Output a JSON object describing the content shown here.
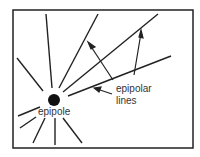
{
  "diagram": {
    "labels": {
      "epipole": "epipole",
      "epipolar_line1": "epipolar",
      "epipolar_line2": "lines"
    },
    "colors": {
      "stroke": "#222222",
      "background": "#ffffff",
      "text": "#333333"
    }
  }
}
